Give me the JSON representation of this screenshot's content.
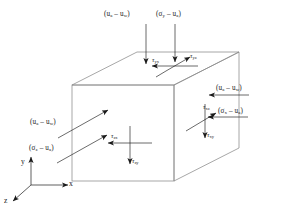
{
  "figure": {
    "type": "diagram",
    "background_color": "#ffffff",
    "line_color": "#808080",
    "arrow_color": "#1a1a1a",
    "text_color": "#1a1a1a"
  },
  "cube": {
    "name": "soil-element-cube",
    "faces": [
      "front-z-face",
      "top-y-face",
      "right-x-face"
    ]
  },
  "axes": {
    "origin_label": "",
    "y": "y",
    "x": "x",
    "z": "z"
  },
  "top_face": {
    "suction": {
      "text": "(u",
      "sub1": "a",
      "mid": " – u",
      "sub2": "w",
      "close": ")",
      "full": "(ua – uw)"
    },
    "net_stress": {
      "text": "(σ",
      "sub1": "y",
      "mid": " – u",
      "sub2": "a",
      "close": ")",
      "full": "(σy – ua)"
    },
    "shear_1": {
      "symbol": "τ",
      "sub": "yx",
      "full": "τyx"
    },
    "shear_2": {
      "symbol": "τ",
      "sub": "yz",
      "full": "τyz"
    }
  },
  "right_face": {
    "suction": {
      "text": "(u",
      "sub1": "a",
      "mid": " – u",
      "sub2": "w",
      "close": ")",
      "full": "(ua – uw)"
    },
    "net_stress": {
      "text": "(σ",
      "sub1": "x",
      "mid": " – u",
      "sub2": "a",
      "close": ")",
      "full": "(σx – ua)"
    },
    "shear_1": {
      "symbol": "τ",
      "sub": "xz",
      "full": "τxz"
    },
    "shear_2": {
      "symbol": "τ",
      "sub": "xy",
      "full": "τxy"
    }
  },
  "front_face": {
    "suction": {
      "text": "(u",
      "sub1": "a",
      "mid": " – u",
      "sub2": "w",
      "close": ")",
      "full": "(ua – uw)"
    },
    "net_stress": {
      "text": "(σ",
      "sub1": "z",
      "mid": " – u",
      "sub2": "a",
      "close": ")",
      "full": "(σz – ua)"
    },
    "shear_1": {
      "symbol": "τ",
      "sub": "zx",
      "full": "τzx"
    },
    "shear_2": {
      "symbol": "τ",
      "sub": "zy",
      "full": "τzy"
    }
  }
}
